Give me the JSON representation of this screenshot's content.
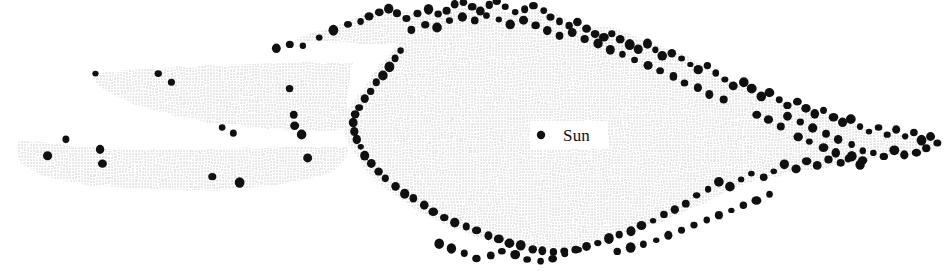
{
  "figure": {
    "type": "scatter-map",
    "caption_text": "",
    "width": 945,
    "height": 271,
    "background_color": "#ffffff",
    "cavity_fill_color": "#efefef",
    "halftone_dot_color": "#9a9a9a",
    "star_dot_color": "#101010"
  },
  "labels": {
    "sun": {
      "text": "Sun",
      "x": 560,
      "y": 126,
      "marker_x": 541,
      "marker_y": 135,
      "marker_radius": 4.2
    }
  },
  "chart_data": {
    "type": "scatter",
    "title": "",
    "xlabel": "",
    "ylabel": "",
    "grid": false,
    "legend": "none",
    "annotations": [
      {
        "text": "Sun",
        "x": 541,
        "y": 135
      }
    ],
    "region_name": "shaded-cavity",
    "region_outline": [
      [
        295,
        40
      ],
      [
        310,
        33
      ],
      [
        330,
        28
      ],
      [
        345,
        22
      ],
      [
        358,
        16
      ],
      [
        372,
        11
      ],
      [
        390,
        8
      ],
      [
        405,
        12
      ],
      [
        420,
        16
      ],
      [
        432,
        14
      ],
      [
        446,
        10
      ],
      [
        458,
        6
      ],
      [
        470,
        3
      ],
      [
        484,
        4
      ],
      [
        497,
        9
      ],
      [
        510,
        14
      ],
      [
        524,
        12
      ],
      [
        538,
        9
      ],
      [
        552,
        13
      ],
      [
        566,
        19
      ],
      [
        580,
        24
      ],
      [
        594,
        27
      ],
      [
        608,
        25
      ],
      [
        620,
        30
      ],
      [
        634,
        36
      ],
      [
        648,
        40
      ],
      [
        660,
        46
      ],
      [
        674,
        52
      ],
      [
        688,
        57
      ],
      [
        700,
        63
      ],
      [
        712,
        70
      ],
      [
        724,
        78
      ],
      [
        736,
        84
      ],
      [
        748,
        90
      ],
      [
        760,
        95
      ],
      [
        772,
        99
      ],
      [
        786,
        103
      ],
      [
        798,
        107
      ],
      [
        812,
        111
      ],
      [
        826,
        116
      ],
      [
        840,
        120
      ],
      [
        854,
        124
      ],
      [
        868,
        128
      ],
      [
        882,
        131
      ],
      [
        896,
        134
      ],
      [
        910,
        136
      ],
      [
        924,
        138
      ],
      [
        938,
        140
      ],
      [
        944,
        143
      ],
      [
        930,
        147
      ],
      [
        916,
        150
      ],
      [
        902,
        152
      ],
      [
        888,
        154
      ],
      [
        874,
        157
      ],
      [
        860,
        160
      ],
      [
        846,
        163
      ],
      [
        832,
        166
      ],
      [
        818,
        169
      ],
      [
        804,
        171
      ],
      [
        790,
        173
      ],
      [
        776,
        176
      ],
      [
        762,
        179
      ],
      [
        748,
        183
      ],
      [
        734,
        188
      ],
      [
        722,
        194
      ],
      [
        710,
        200
      ],
      [
        698,
        206
      ],
      [
        686,
        212
      ],
      [
        672,
        218
      ],
      [
        658,
        223
      ],
      [
        644,
        228
      ],
      [
        630,
        232
      ],
      [
        616,
        236
      ],
      [
        602,
        240
      ],
      [
        588,
        244
      ],
      [
        574,
        247
      ],
      [
        560,
        249
      ],
      [
        546,
        250
      ],
      [
        532,
        249
      ],
      [
        518,
        247
      ],
      [
        504,
        244
      ],
      [
        490,
        240
      ],
      [
        476,
        236
      ],
      [
        462,
        231
      ],
      [
        448,
        226
      ],
      [
        436,
        220
      ],
      [
        424,
        214
      ],
      [
        412,
        207
      ],
      [
        402,
        200
      ],
      [
        392,
        193
      ],
      [
        382,
        186
      ],
      [
        374,
        178
      ],
      [
        366,
        170
      ],
      [
        360,
        162
      ],
      [
        354,
        154
      ],
      [
        350,
        146
      ],
      [
        346,
        138
      ],
      [
        344,
        130
      ],
      [
        344,
        122
      ],
      [
        346,
        114
      ],
      [
        350,
        106
      ],
      [
        356,
        98
      ],
      [
        362,
        90
      ],
      [
        368,
        82
      ],
      [
        374,
        74
      ],
      [
        380,
        66
      ],
      [
        386,
        58
      ],
      [
        392,
        50
      ],
      [
        398,
        44
      ],
      [
        380,
        44
      ],
      [
        362,
        44
      ],
      [
        344,
        43
      ],
      [
        326,
        42
      ],
      [
        308,
        41
      ]
    ],
    "arm_upper_left_outline": [
      [
        352,
        62
      ],
      [
        300,
        62
      ],
      [
        250,
        64
      ],
      [
        200,
        66
      ],
      [
        160,
        68
      ],
      [
        128,
        70
      ],
      [
        104,
        72
      ],
      [
        92,
        76
      ],
      [
        96,
        84
      ],
      [
        112,
        94
      ],
      [
        134,
        104
      ],
      [
        160,
        112
      ],
      [
        190,
        119
      ],
      [
        222,
        124
      ],
      [
        256,
        128
      ],
      [
        290,
        130
      ],
      [
        320,
        131
      ],
      [
        344,
        130
      ],
      [
        348,
        118
      ],
      [
        348,
        96
      ],
      [
        350,
        78
      ]
    ],
    "arm_lower_left_outline": [
      [
        348,
        146
      ],
      [
        320,
        146
      ],
      [
        290,
        147
      ],
      [
        258,
        148
      ],
      [
        224,
        149
      ],
      [
        190,
        150
      ],
      [
        156,
        150
      ],
      [
        122,
        149
      ],
      [
        90,
        147
      ],
      [
        60,
        144
      ],
      [
        34,
        141
      ],
      [
        18,
        140
      ],
      [
        16,
        150
      ],
      [
        20,
        162
      ],
      [
        32,
        172
      ],
      [
        54,
        179
      ],
      [
        82,
        184
      ],
      [
        114,
        187
      ],
      [
        148,
        189
      ],
      [
        182,
        190
      ],
      [
        216,
        190
      ],
      [
        250,
        188
      ],
      [
        284,
        184
      ],
      [
        314,
        178
      ],
      [
        336,
        170
      ],
      [
        346,
        160
      ]
    ],
    "arm_right_tip_outline": [
      [
        880,
        143
      ],
      [
        900,
        141
      ],
      [
        918,
        140
      ],
      [
        932,
        141
      ],
      [
        944,
        144
      ],
      [
        936,
        150
      ],
      [
        920,
        154
      ],
      [
        902,
        156
      ],
      [
        884,
        156
      ],
      [
        870,
        154
      ],
      [
        864,
        149
      ]
    ],
    "points_description": "black filled dots marking stars, concentrated along the cavity boundary",
    "points": [
      [
        95,
        73
      ],
      [
        159,
        73
      ],
      [
        171,
        82
      ],
      [
        222,
        127
      ],
      [
        234,
        133
      ],
      [
        290,
        88
      ],
      [
        293,
        115
      ],
      [
        295,
        126
      ],
      [
        47,
        156
      ],
      [
        66,
        140
      ],
      [
        100,
        150
      ],
      [
        102,
        163
      ],
      [
        213,
        176
      ],
      [
        240,
        182
      ],
      [
        302,
        135
      ],
      [
        307,
        158
      ],
      [
        276,
        49
      ],
      [
        289,
        45
      ],
      [
        303,
        45
      ],
      [
        319,
        38
      ],
      [
        334,
        30
      ],
      [
        348,
        25
      ],
      [
        361,
        22
      ],
      [
        369,
        16
      ],
      [
        379,
        13
      ],
      [
        389,
        9
      ],
      [
        397,
        14
      ],
      [
        407,
        18
      ],
      [
        417,
        13
      ],
      [
        428,
        9
      ],
      [
        438,
        14
      ],
      [
        447,
        10
      ],
      [
        455,
        5
      ],
      [
        463,
        3
      ],
      [
        472,
        7
      ],
      [
        481,
        11
      ],
      [
        490,
        5
      ],
      [
        497,
        2
      ],
      [
        506,
        7
      ],
      [
        516,
        12
      ],
      [
        524,
        9
      ],
      [
        533,
        5
      ],
      [
        543,
        11
      ],
      [
        551,
        17
      ],
      [
        560,
        22
      ],
      [
        569,
        26
      ],
      [
        577,
        22
      ],
      [
        586,
        28
      ],
      [
        595,
        34
      ],
      [
        604,
        38
      ],
      [
        612,
        33
      ],
      [
        620,
        39
      ],
      [
        629,
        45
      ],
      [
        638,
        49
      ],
      [
        647,
        44
      ],
      [
        655,
        50
      ],
      [
        663,
        56
      ],
      [
        672,
        53
      ],
      [
        681,
        59
      ],
      [
        690,
        64
      ],
      [
        699,
        69
      ],
      [
        708,
        66
      ],
      [
        716,
        73
      ],
      [
        725,
        80
      ],
      [
        734,
        86
      ],
      [
        743,
        82
      ],
      [
        752,
        89
      ],
      [
        761,
        96
      ],
      [
        770,
        92
      ],
      [
        779,
        99
      ],
      [
        788,
        105
      ],
      [
        797,
        101
      ],
      [
        806,
        108
      ],
      [
        815,
        114
      ],
      [
        824,
        110
      ],
      [
        833,
        117
      ],
      [
        842,
        123
      ],
      [
        851,
        119
      ],
      [
        860,
        126
      ],
      [
        869,
        132
      ],
      [
        878,
        128
      ],
      [
        887,
        135
      ],
      [
        896,
        130
      ],
      [
        905,
        137
      ],
      [
        914,
        133
      ],
      [
        922,
        140
      ],
      [
        931,
        136
      ],
      [
        938,
        143
      ],
      [
        926,
        149
      ],
      [
        916,
        152
      ],
      [
        905,
        155
      ],
      [
        894,
        151
      ],
      [
        884,
        157
      ],
      [
        873,
        153
      ],
      [
        862,
        160
      ],
      [
        851,
        156
      ],
      [
        840,
        163
      ],
      [
        829,
        159
      ],
      [
        818,
        166
      ],
      [
        807,
        162
      ],
      [
        796,
        169
      ],
      [
        785,
        165
      ],
      [
        774,
        172
      ],
      [
        763,
        177
      ],
      [
        752,
        173
      ],
      [
        741,
        180
      ],
      [
        730,
        186
      ],
      [
        719,
        182
      ],
      [
        708,
        189
      ],
      [
        697,
        196
      ],
      [
        686,
        203
      ],
      [
        675,
        209
      ],
      [
        664,
        215
      ],
      [
        653,
        221
      ],
      [
        642,
        226
      ],
      [
        631,
        231
      ],
      [
        620,
        235
      ],
      [
        609,
        239
      ],
      [
        598,
        243
      ],
      [
        587,
        246
      ],
      [
        576,
        249
      ],
      [
        565,
        251
      ],
      [
        554,
        252
      ],
      [
        543,
        251
      ],
      [
        532,
        249
      ],
      [
        521,
        246
      ],
      [
        510,
        243
      ],
      [
        499,
        239
      ],
      [
        488,
        235
      ],
      [
        477,
        231
      ],
      [
        466,
        226
      ],
      [
        455,
        222
      ],
      [
        444,
        217
      ],
      [
        434,
        211
      ],
      [
        424,
        205
      ],
      [
        414,
        199
      ],
      [
        404,
        193
      ],
      [
        395,
        186
      ],
      [
        386,
        179
      ],
      [
        378,
        171
      ],
      [
        371,
        163
      ],
      [
        365,
        155
      ],
      [
        360,
        147
      ],
      [
        356,
        139
      ],
      [
        354,
        131
      ],
      [
        353,
        123
      ],
      [
        355,
        115
      ],
      [
        359,
        107
      ],
      [
        365,
        99
      ],
      [
        371,
        91
      ],
      [
        377,
        83
      ],
      [
        383,
        75
      ],
      [
        389,
        67
      ],
      [
        395,
        59
      ],
      [
        401,
        51
      ],
      [
        412,
        30
      ],
      [
        425,
        24
      ],
      [
        437,
        27
      ],
      [
        449,
        20
      ],
      [
        462,
        17
      ],
      [
        474,
        21
      ],
      [
        486,
        16
      ],
      [
        499,
        19
      ],
      [
        511,
        24
      ],
      [
        523,
        20
      ],
      [
        536,
        25
      ],
      [
        548,
        31
      ],
      [
        560,
        36
      ],
      [
        573,
        33
      ],
      [
        585,
        39
      ],
      [
        598,
        44
      ],
      [
        610,
        49
      ],
      [
        623,
        54
      ],
      [
        635,
        60
      ],
      [
        648,
        65
      ],
      [
        660,
        71
      ],
      [
        673,
        77
      ],
      [
        685,
        83
      ],
      [
        698,
        88
      ],
      [
        710,
        94
      ],
      [
        723,
        100
      ],
      [
        788,
        117
      ],
      [
        800,
        122
      ],
      [
        813,
        128
      ],
      [
        826,
        133
      ],
      [
        838,
        139
      ],
      [
        851,
        144
      ],
      [
        863,
        150
      ],
      [
        798,
        137
      ],
      [
        810,
        142
      ],
      [
        823,
        148
      ],
      [
        835,
        153
      ],
      [
        848,
        159
      ],
      [
        860,
        165
      ],
      [
        756,
        114
      ],
      [
        769,
        120
      ],
      [
        781,
        126
      ],
      [
        440,
        243
      ],
      [
        452,
        248
      ],
      [
        465,
        253
      ],
      [
        477,
        258
      ],
      [
        490,
        256
      ],
      [
        502,
        251
      ],
      [
        515,
        255
      ],
      [
        527,
        259
      ],
      [
        540,
        262
      ],
      [
        553,
        258
      ],
      [
        565,
        254
      ],
      [
        578,
        250
      ],
      [
        618,
        252
      ],
      [
        631,
        248
      ],
      [
        644,
        244
      ],
      [
        657,
        240
      ],
      [
        669,
        235
      ],
      [
        682,
        230
      ],
      [
        694,
        225
      ],
      [
        707,
        220
      ],
      [
        719,
        215
      ],
      [
        732,
        210
      ],
      [
        744,
        205
      ],
      [
        757,
        200
      ],
      [
        769,
        195
      ]
    ]
  }
}
